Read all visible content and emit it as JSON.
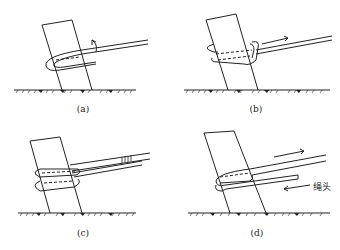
{
  "figure": {
    "panels": [
      {
        "id": "a",
        "caption": "(a)"
      },
      {
        "id": "b",
        "caption": "(b)"
      },
      {
        "id": "c",
        "caption": "(c)"
      },
      {
        "id": "d",
        "caption": "(d)",
        "annotation": "绳头"
      }
    ],
    "colors": {
      "line": "#222222",
      "background": "#ffffff"
    }
  }
}
